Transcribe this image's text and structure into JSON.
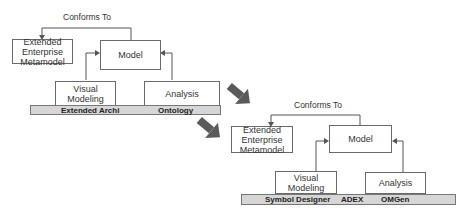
{
  "diagrams": [
    {
      "name": "before",
      "conforms_label": "Conforms To",
      "boxes": {
        "metamodel": [
          "Extended",
          "Enterprise",
          "Metamodel"
        ],
        "model": "Model",
        "visual": [
          "Visual",
          "Modeling"
        ],
        "analysis": "Analysis"
      },
      "bar_labels": [
        "Extended Archi",
        "Ontology"
      ]
    },
    {
      "name": "after",
      "conforms_label": "Conforms To",
      "boxes": {
        "metamodel": [
          "Extended",
          "Enterprise",
          "Metamodel"
        ],
        "model": "Model",
        "visual": [
          "Visual",
          "Modeling"
        ],
        "analysis": "Analysis"
      },
      "bar_labels": [
        "Symbol Designer",
        "ADEX",
        "OMGen"
      ]
    }
  ],
  "colors": {
    "arrow": "#5a5a5a",
    "bar": "#d6d6d6",
    "border": "#6a6a6a"
  }
}
